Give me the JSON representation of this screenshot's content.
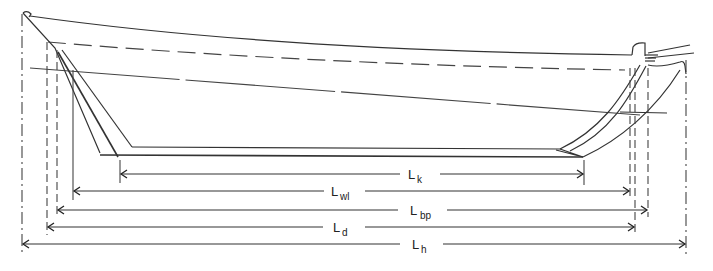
{
  "diagram": {
    "dimensions": [
      {
        "id": "k",
        "symbol": "L",
        "subscript": "k",
        "meaning_hint": "keel length"
      },
      {
        "id": "wl",
        "symbol": "L",
        "subscript": "wl",
        "meaning_hint": "waterline length"
      },
      {
        "id": "bp",
        "symbol": "L",
        "subscript": "bp",
        "meaning_hint": "length between perpendiculars"
      },
      {
        "id": "d",
        "symbol": "L",
        "subscript": "d",
        "meaning_hint": "deck length"
      },
      {
        "id": "h",
        "symbol": "L",
        "subscript": "h",
        "meaning_hint": "hull length"
      }
    ],
    "labels": {
      "k": {
        "main": "L",
        "sub": "k"
      },
      "wl": {
        "main": "L",
        "sub": "wl"
      },
      "bp": {
        "main": "L",
        "sub": "bp"
      },
      "d": {
        "main": "L",
        "sub": "d"
      },
      "h": {
        "main": "L",
        "sub": "h"
      }
    },
    "colors": {
      "line": "#333333",
      "background": "#ffffff"
    }
  }
}
